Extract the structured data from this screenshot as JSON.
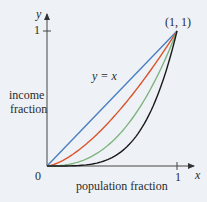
{
  "chart_data": {
    "type": "line",
    "title": "",
    "xlabel": "population fraction",
    "ylabel": "income fraction",
    "axis_x_name": "x",
    "axis_y_name": "y",
    "xlim": [
      0,
      1
    ],
    "ylim": [
      0,
      1
    ],
    "x_ticks": [
      "0",
      "1"
    ],
    "y_ticks": [
      "1"
    ],
    "grid": false,
    "annotations": [
      {
        "text": "y = x",
        "target": "diagonal line"
      },
      {
        "text": "(1, 1)",
        "x": 1,
        "y": 1
      }
    ],
    "x": [
      0,
      0.1,
      0.2,
      0.3,
      0.4,
      0.5,
      0.6,
      0.7,
      0.8,
      0.9,
      1.0
    ],
    "series": [
      {
        "name": "y = x",
        "color": "#4a7fc1",
        "values": [
          0,
          0.1,
          0.2,
          0.3,
          0.4,
          0.5,
          0.6,
          0.7,
          0.8,
          0.9,
          1.0
        ]
      },
      {
        "name": "Lorenz curve 1",
        "color": "#d9532b",
        "values": [
          0,
          0.03,
          0.09,
          0.16,
          0.25,
          0.35,
          0.46,
          0.59,
          0.72,
          0.85,
          1.0
        ]
      },
      {
        "name": "Lorenz curve 2",
        "color": "#7fb37f",
        "values": [
          0,
          0.003,
          0.02,
          0.05,
          0.1,
          0.18,
          0.28,
          0.41,
          0.57,
          0.77,
          1.0
        ]
      },
      {
        "name": "Lorenz curve 3",
        "color": "#1a1a1a",
        "values": [
          0,
          0.0001,
          0.0016,
          0.008,
          0.026,
          0.0625,
          0.13,
          0.24,
          0.41,
          0.66,
          1.0
        ]
      }
    ]
  },
  "labels": {
    "y_axis_var": "y",
    "x_axis_var": "x",
    "y_tick_1": "1",
    "x_tick_1": "1",
    "origin": "0",
    "point": "(1, 1)",
    "diag": "y = x",
    "ylabel_line1": "income",
    "ylabel_line2": "fraction",
    "xlabel": "population fraction"
  }
}
